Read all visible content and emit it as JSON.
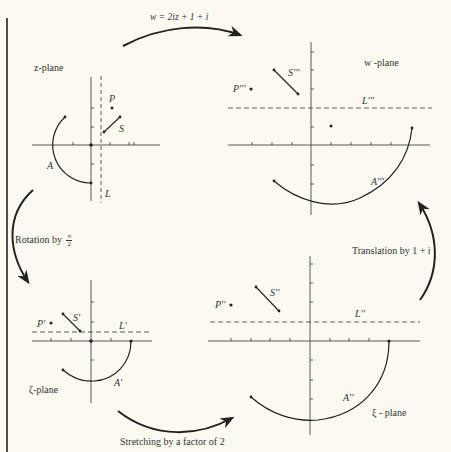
{
  "figure": {
    "background": "#fbfaf1",
    "ink": "#222222"
  },
  "planes": {
    "z": {
      "title": "z-plane",
      "point_label": "P",
      "segment_label": "S",
      "arc_label": "A",
      "line_label": "L"
    },
    "w": {
      "title": "w -plane",
      "point_label": "P'''",
      "segment_label": "S'''",
      "arc_label": "A'''",
      "line_label": "L'''"
    },
    "zeta": {
      "title": "ζ-plane",
      "point_label": "P'",
      "segment_label": "S'",
      "arc_label": "A'",
      "line_label": "L'"
    },
    "xi": {
      "title": "ξ - plane",
      "point_label": "P''",
      "segment_label": "S''",
      "arc_label": "A''",
      "line_label": "L''"
    }
  },
  "transforms": {
    "top": "w = 2iz + 1 + i",
    "left_prefix": "Rotation by",
    "left_frac_num": "π",
    "left_frac_den": "2",
    "bottom": "Stretching by a factor of 2",
    "right": "Translation by 1 + i"
  }
}
